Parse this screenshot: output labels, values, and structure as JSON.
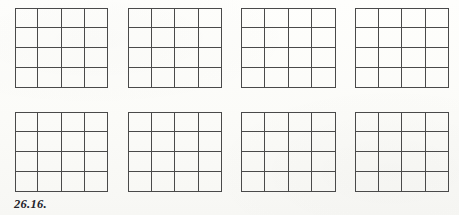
{
  "figure": {
    "caption": "26.16.",
    "caption_x": 14,
    "caption_y": 197,
    "line_color": "#4a4a4a",
    "background_color": "#fdfdfb",
    "grid_count": 8,
    "rows_of_grids": 2,
    "columns_of_grids": 4,
    "grids": [
      {
        "name": "grid-1",
        "rows": 4,
        "cols": 4,
        "x": 15,
        "y": 8,
        "width": 93,
        "height": 80
      },
      {
        "name": "grid-2",
        "rows": 4,
        "cols": 4,
        "x": 128,
        "y": 8,
        "width": 94,
        "height": 80
      },
      {
        "name": "grid-3",
        "rows": 4,
        "cols": 4,
        "x": 241,
        "y": 8,
        "width": 95,
        "height": 80
      },
      {
        "name": "grid-4",
        "rows": 4,
        "cols": 4,
        "x": 355,
        "y": 8,
        "width": 94,
        "height": 80
      },
      {
        "name": "grid-5",
        "rows": 4,
        "cols": 4,
        "x": 15,
        "y": 112,
        "width": 93,
        "height": 80
      },
      {
        "name": "grid-6",
        "rows": 4,
        "cols": 4,
        "x": 128,
        "y": 112,
        "width": 94,
        "height": 80
      },
      {
        "name": "grid-7",
        "rows": 4,
        "cols": 4,
        "x": 241,
        "y": 112,
        "width": 95,
        "height": 80
      },
      {
        "name": "grid-8",
        "rows": 4,
        "cols": 4,
        "x": 355,
        "y": 112,
        "width": 94,
        "height": 80
      }
    ],
    "cell_values": [
      [
        [
          "",
          "",
          "",
          ""
        ],
        [
          "",
          "",
          "",
          ""
        ],
        [
          "",
          "",
          "",
          ""
        ],
        [
          "",
          "",
          "",
          ""
        ]
      ],
      [
        [
          "",
          "",
          "",
          ""
        ],
        [
          "",
          "",
          "",
          ""
        ],
        [
          "",
          "",
          "",
          ""
        ],
        [
          "",
          "",
          "",
          ""
        ]
      ],
      [
        [
          "",
          "",
          "",
          ""
        ],
        [
          "",
          "",
          "",
          ""
        ],
        [
          "",
          "",
          "",
          ""
        ],
        [
          "",
          "",
          "",
          ""
        ]
      ],
      [
        [
          "",
          "",
          "",
          ""
        ],
        [
          "",
          "",
          "",
          ""
        ],
        [
          "",
          "",
          "",
          ""
        ],
        [
          "",
          "",
          "",
          ""
        ]
      ],
      [
        [
          "",
          "",
          "",
          ""
        ],
        [
          "",
          "",
          "",
          ""
        ],
        [
          "",
          "",
          "",
          ""
        ],
        [
          "",
          "",
          "",
          ""
        ]
      ],
      [
        [
          "",
          "",
          "",
          ""
        ],
        [
          "",
          "",
          "",
          ""
        ],
        [
          "",
          "",
          "",
          ""
        ],
        [
          "",
          "",
          "",
          ""
        ]
      ],
      [
        [
          "",
          "",
          "",
          ""
        ],
        [
          "",
          "",
          "",
          ""
        ],
        [
          "",
          "",
          "",
          ""
        ],
        [
          "",
          "",
          "",
          ""
        ]
      ],
      [
        [
          "",
          "",
          "",
          ""
        ],
        [
          "",
          "",
          "",
          ""
        ],
        [
          "",
          "",
          "",
          ""
        ],
        [
          "",
          "",
          "",
          ""
        ]
      ]
    ]
  }
}
